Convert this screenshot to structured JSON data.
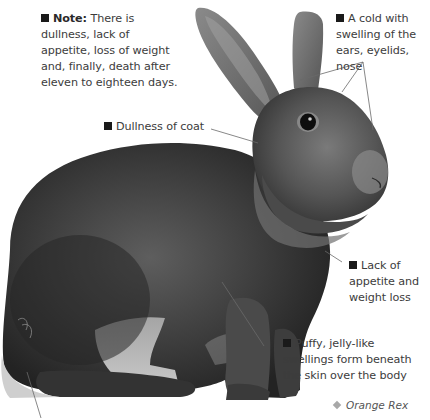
{
  "figure": {
    "caption": "Orange Rex",
    "caption_icon": "diamond-bullet-icon"
  },
  "callouts": {
    "note": {
      "label": "Note:",
      "text": "There is dullness, lack of appetite, loss of weight and, finally, death after eleven to eighteen days.",
      "lines": [
        "There is",
        "dullness, lack of",
        "appetite, loss of weight",
        "and, finally, death after",
        "eleven to eighteen days."
      ]
    },
    "cold": {
      "text": "A cold with swelling of the ears, eyelids, nose",
      "lines": [
        "A cold with",
        "swelling of the",
        "ears, eyelids, nose"
      ]
    },
    "coat": {
      "text": "Dullness of coat",
      "lines": [
        "Dullness of coat"
      ]
    },
    "appetite": {
      "text": "Lack of appetite and weight loss",
      "lines": [
        "Lack of",
        "appetite and",
        "weight loss"
      ]
    },
    "swellings": {
      "text": "Puffy, jelly-like swellings form beneath the skin over the body",
      "lines": [
        "Puffy, jelly-like",
        "swellings form beneath",
        "the skin over the body"
      ]
    }
  },
  "colors": {
    "background": "#ffffff",
    "text": "#3c3c3c",
    "bullet": "#1a1a1a",
    "leader_line": "#6a6a6a",
    "fur_dark": "#2e2e2e",
    "fur_mid": "#5a5a5a",
    "fur_light": "#9a9a9a"
  }
}
